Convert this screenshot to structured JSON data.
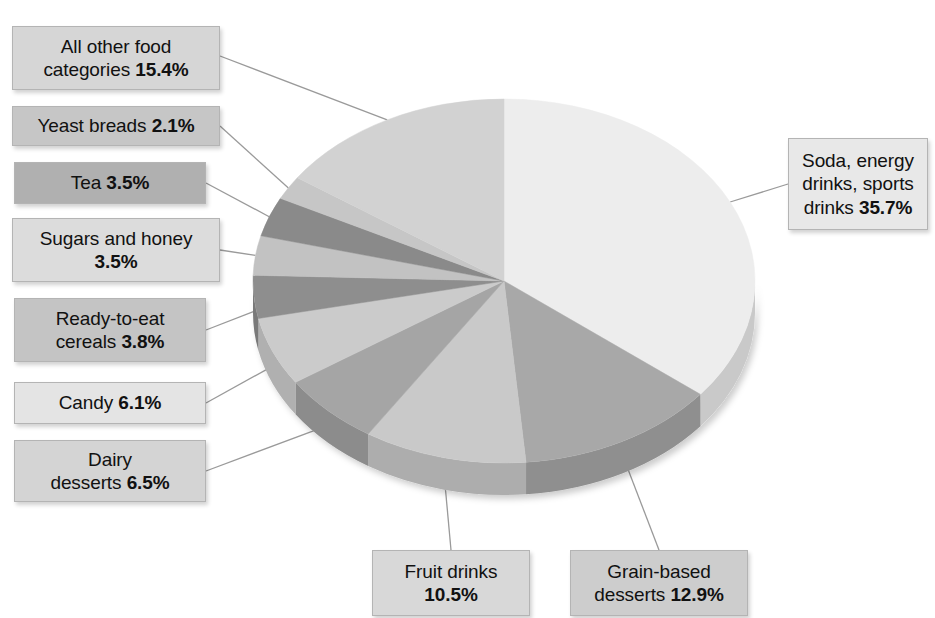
{
  "chart_data": {
    "type": "pie",
    "title": "",
    "subtitle": "",
    "xlabel": "",
    "ylabel": "",
    "legend_position": "callout-labels",
    "grid": false,
    "units": "percent",
    "total": 100.0,
    "start_angle_deg": 0,
    "direction": "clockwise",
    "categories": [
      "Soda, energy drinks, sports drinks",
      "Grain-based desserts",
      "Fruit drinks",
      "Dairy desserts",
      "Candy",
      "Ready-to-eat cereals",
      "Sugars and honey",
      "Tea",
      "Yeast breads",
      "All other food categories"
    ],
    "values": [
      35.7,
      12.9,
      10.5,
      6.5,
      6.1,
      3.8,
      3.5,
      3.5,
      2.1,
      15.4
    ],
    "value_labels": [
      "35.7%",
      "12.9%",
      "10.5%",
      "6.5%",
      "6.1%",
      "3.8%",
      "3.5%",
      "3.5%",
      "2.1%",
      "15.4%"
    ],
    "slice_colors": [
      "#ededed",
      "#a8a8a8",
      "#c9c9c9",
      "#a5a5a5",
      "#cbcbcb",
      "#8e8e8e",
      "#c2c2c2",
      "#8a8a8a",
      "#c6c6c6",
      "#d2d2d2"
    ],
    "side_colors": [
      "#c9c9c9",
      "#8f8f8f",
      "#adadad",
      "#8c8c8c",
      "#b0b0b0",
      "#797979",
      "#a6a6a6",
      "#757575",
      "#aaaaaa",
      "#b4b4b4"
    ]
  },
  "labels": [
    {
      "id": "all-other-food-categories",
      "text": "All other food categories",
      "pct": "15.4%",
      "lines": [
        "All other food",
        "categories"
      ],
      "pct_on_line": 1,
      "box_fill": "#d6d6d6"
    },
    {
      "id": "yeast-breads",
      "text": "Yeast breads",
      "pct": "2.1%",
      "lines": [
        "Yeast breads"
      ],
      "pct_on_line": 0,
      "box_fill": "#c6c6c6"
    },
    {
      "id": "tea",
      "text": "Tea",
      "pct": "3.5%",
      "lines": [
        "Tea"
      ],
      "pct_on_line": 0,
      "box_fill": "#b0b0b0"
    },
    {
      "id": "sugars-and-honey",
      "text": "Sugars and honey",
      "pct": "3.5%",
      "lines": [
        "Sugars and honey",
        ""
      ],
      "pct_on_line": 1,
      "box_fill": "#dcdcdc"
    },
    {
      "id": "ready-to-eat-cereals",
      "text": "Ready-to-eat cereals",
      "pct": "3.8%",
      "lines": [
        "Ready-to-eat",
        "cereals"
      ],
      "pct_on_line": 1,
      "box_fill": "#c4c4c4"
    },
    {
      "id": "candy",
      "text": "Candy",
      "pct": "6.1%",
      "lines": [
        "Candy"
      ],
      "pct_on_line": 0,
      "box_fill": "#e4e4e4"
    },
    {
      "id": "dairy-desserts",
      "text": "Dairy desserts",
      "pct": "6.5%",
      "lines": [
        "Dairy",
        "desserts"
      ],
      "pct_on_line": 1,
      "box_fill": "#d4d4d4"
    },
    {
      "id": "fruit-drinks",
      "text": "Fruit drinks",
      "pct": "10.5%",
      "lines": [
        "Fruit drinks",
        ""
      ],
      "pct_on_line": 1,
      "box_fill": "#d8d8d8"
    },
    {
      "id": "grain-based-desserts",
      "text": "Grain-based desserts",
      "pct": "12.9%",
      "lines": [
        "Grain-based",
        "desserts"
      ],
      "pct_on_line": 1,
      "box_fill": "#cdcdcd"
    },
    {
      "id": "soda-energy-drinks-sports-drinks",
      "text": "Soda, energy drinks, sports drinks",
      "pct": "35.7%",
      "lines": [
        "Soda, energy",
        "drinks, sports",
        "drinks"
      ],
      "pct_on_line": 2,
      "box_fill": "#e8e8e8"
    }
  ]
}
